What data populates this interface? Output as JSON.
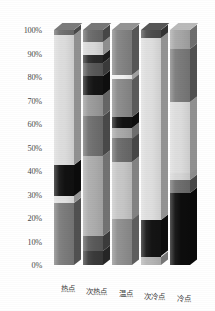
{
  "chart_data": {
    "type": "bar",
    "subtype": "100% stacked column, 3D",
    "title": "",
    "xlabel": "",
    "ylabel": "",
    "ylim": [
      0,
      100
    ],
    "y_unit": "%",
    "grid": false,
    "legend": "none",
    "axis": {
      "y_ticks": [
        "0%",
        "10%",
        "20%",
        "30%",
        "40%",
        "50%",
        "60%",
        "70%",
        "80%",
        "90%",
        "100%"
      ],
      "y_tick_values": [
        0,
        10,
        20,
        30,
        40,
        50,
        60,
        70,
        80,
        90,
        100
      ]
    },
    "categories": [
      "热点",
      "次热点",
      "温点",
      "次冷点",
      "冷点"
    ],
    "series": [
      {
        "name": "热点",
        "segments": [
          {
            "from": 0,
            "to": 26.5,
            "value": 26.5,
            "color": "#7b7b7b"
          },
          {
            "from": 26.5,
            "to": 29.5,
            "value": 3.0,
            "color": "#e2e2e2"
          },
          {
            "from": 29.5,
            "to": 42.5,
            "value": 13.0,
            "color": "#111111"
          },
          {
            "from": 42.5,
            "to": 98.0,
            "value": 55.5,
            "color": "#dcdcdc"
          },
          {
            "from": 98.0,
            "to": 100.0,
            "value": 2.0,
            "color": "#6e6e6e"
          }
        ]
      },
      {
        "name": "次热点",
        "segments": [
          {
            "from": 0,
            "to": 6.0,
            "value": 6.0,
            "color": "#3a3a3a"
          },
          {
            "from": 6.0,
            "to": 12.5,
            "value": 6.5,
            "color": "#5a5a5a"
          },
          {
            "from": 12.5,
            "to": 46.5,
            "value": 34.0,
            "color": "#adadad"
          },
          {
            "from": 46.5,
            "to": 63.5,
            "value": 17.0,
            "color": "#6f6f6f"
          },
          {
            "from": 63.5,
            "to": 72.5,
            "value": 9.0,
            "color": "#9a9a9a"
          },
          {
            "from": 72.5,
            "to": 80.5,
            "value": 8.0,
            "color": "#151515"
          },
          {
            "from": 80.5,
            "to": 86.0,
            "value": 5.5,
            "color": "#585858"
          },
          {
            "from": 86.0,
            "to": 89.5,
            "value": 3.5,
            "color": "#2a2a2a"
          },
          {
            "from": 89.5,
            "to": 95.0,
            "value": 5.5,
            "color": "#d8d8d8"
          },
          {
            "from": 95.0,
            "to": 100.0,
            "value": 5.0,
            "color": "#6a6a6a"
          }
        ]
      },
      {
        "name": "温点",
        "segments": [
          {
            "from": 0,
            "to": 19.5,
            "value": 19.5,
            "color": "#8e8e8e"
          },
          {
            "from": 19.5,
            "to": 44.0,
            "value": 24.5,
            "color": "#c6c6c6"
          },
          {
            "from": 44.0,
            "to": 54.0,
            "value": 10.0,
            "color": "#6b6b6b"
          },
          {
            "from": 54.0,
            "to": 58.5,
            "value": 4.5,
            "color": "#a8a8a8"
          },
          {
            "from": 58.5,
            "to": 63.0,
            "value": 4.5,
            "color": "#121212"
          },
          {
            "from": 63.0,
            "to": 79.0,
            "value": 16.0,
            "color": "#8a8a8a"
          },
          {
            "from": 79.0,
            "to": 81.0,
            "value": 2.0,
            "color": "#f2f2f2"
          },
          {
            "from": 81.0,
            "to": 100.0,
            "value": 19.0,
            "color": "#838383"
          }
        ]
      },
      {
        "name": "次冷点",
        "segments": [
          {
            "from": 0,
            "to": 3.5,
            "value": 3.5,
            "color": "#b5b5b5"
          },
          {
            "from": 3.5,
            "to": 19.0,
            "value": 15.5,
            "color": "#141414"
          },
          {
            "from": 19.0,
            "to": 96.5,
            "value": 77.5,
            "color": "#dedede"
          },
          {
            "from": 96.5,
            "to": 100.0,
            "value": 3.5,
            "color": "#4d4d4d"
          }
        ]
      },
      {
        "name": "冷点",
        "segments": [
          {
            "from": 0,
            "to": 30.5,
            "value": 30.5,
            "color": "#0d0d0d"
          },
          {
            "from": 30.5,
            "to": 36.0,
            "value": 5.5,
            "color": "#6d6d6d"
          },
          {
            "from": 36.0,
            "to": 39.0,
            "value": 3.0,
            "color": "#d5d5d5"
          },
          {
            "from": 39.0,
            "to": 69.5,
            "value": 30.5,
            "color": "#dcdcdc"
          },
          {
            "from": 69.5,
            "to": 92.0,
            "value": 22.5,
            "color": "#7a7a7a"
          },
          {
            "from": 92.0,
            "to": 100.0,
            "value": 8.0,
            "color": "#a6a6a6"
          }
        ]
      }
    ]
  }
}
